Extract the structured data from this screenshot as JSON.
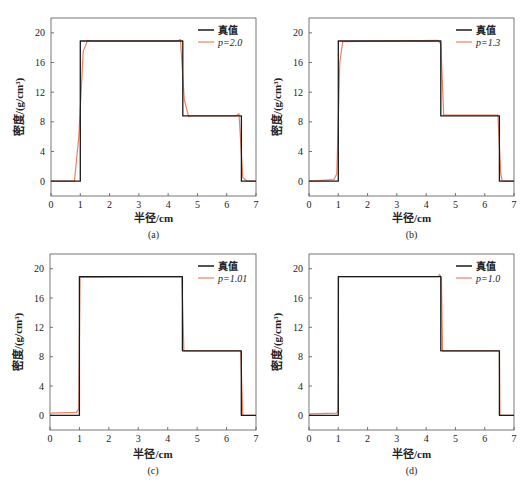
{
  "figure": {
    "background": "#ffffff",
    "colors": {
      "true_value": "#1a1a1a",
      "reconstruction": "#f08060",
      "axis": "#555555"
    }
  },
  "chart_data": [
    {
      "type": "line",
      "panel_label": "(a)",
      "xlabel": "半径/cm",
      "ylabel": "密度/(g/cm³)",
      "xlim": [
        0,
        7
      ],
      "ylim": [
        -2,
        22
      ],
      "xticks": [
        0,
        1,
        2,
        3,
        4,
        5,
        6,
        7
      ],
      "yticks": [
        0,
        4,
        8,
        12,
        16,
        20
      ],
      "grid": false,
      "legend_position": "upper right",
      "series": [
        {
          "name": "真值",
          "color": "#1a1a1a",
          "x": [
            0,
            1.0,
            1.0,
            4.5,
            4.5,
            6.5,
            6.5,
            7
          ],
          "y": [
            0,
            0,
            18.9,
            18.9,
            8.8,
            8.8,
            0,
            0
          ]
        },
        {
          "name": "p=2.0",
          "color": "#f08060",
          "x": [
            0,
            0.8,
            0.95,
            1.1,
            1.25,
            1.4,
            4.3,
            4.42,
            4.55,
            4.7,
            4.85,
            6.3,
            6.42,
            6.55,
            6.7,
            7
          ],
          "y": [
            0,
            0,
            6,
            17.5,
            19.0,
            18.9,
            18.9,
            19.1,
            11,
            8.7,
            8.8,
            8.8,
            9.1,
            0.5,
            0,
            0
          ]
        }
      ]
    },
    {
      "type": "line",
      "panel_label": "(b)",
      "xlabel": "半径/cm",
      "ylabel": "密度/(g/cm³)",
      "xlim": [
        0,
        7
      ],
      "ylim": [
        -2,
        22
      ],
      "xticks": [
        0,
        1,
        2,
        3,
        4,
        5,
        6,
        7
      ],
      "yticks": [
        0,
        4,
        8,
        12,
        16,
        20
      ],
      "grid": false,
      "legend_position": "upper right",
      "series": [
        {
          "name": "真值",
          "color": "#1a1a1a",
          "x": [
            0,
            1.0,
            1.0,
            4.5,
            4.5,
            6.5,
            6.5,
            7
          ],
          "y": [
            0,
            0,
            18.9,
            18.9,
            8.8,
            8.8,
            0,
            0
          ]
        },
        {
          "name": "p=1.3",
          "color": "#f08060",
          "x": [
            0,
            0.85,
            0.95,
            1.05,
            1.15,
            4.4,
            4.5,
            4.6,
            6.45,
            6.55,
            6.6,
            7
          ],
          "y": [
            0,
            0.2,
            1.0,
            16,
            18.8,
            19.0,
            18.5,
            8.9,
            8.9,
            1.0,
            0,
            0
          ]
        }
      ]
    },
    {
      "type": "line",
      "panel_label": "(c)",
      "xlabel": "半径/cm",
      "ylabel": "密度/(g/cm³)",
      "xlim": [
        0,
        7
      ],
      "ylim": [
        -2,
        22
      ],
      "xticks": [
        0,
        1,
        2,
        3,
        4,
        5,
        6,
        7
      ],
      "yticks": [
        0,
        4,
        8,
        12,
        16,
        20
      ],
      "grid": false,
      "legend_position": "upper right",
      "series": [
        {
          "name": "真值",
          "color": "#1a1a1a",
          "x": [
            0,
            1.0,
            1.0,
            4.5,
            4.5,
            6.5,
            6.5,
            7
          ],
          "y": [
            0,
            0,
            18.9,
            18.9,
            8.8,
            8.8,
            0,
            0
          ]
        },
        {
          "name": "p=1.01",
          "color": "#f08060",
          "x": [
            0,
            0.9,
            0.98,
            1.02,
            4.48,
            4.55,
            6.48,
            6.55,
            7
          ],
          "y": [
            0.3,
            0.4,
            0.9,
            18.8,
            18.9,
            8.8,
            8.8,
            0,
            0
          ]
        }
      ]
    },
    {
      "type": "line",
      "panel_label": "(d)",
      "xlabel": "半径/cm",
      "ylabel": "密度/(g/cm³)",
      "xlim": [
        0,
        7
      ],
      "ylim": [
        -2,
        22
      ],
      "xticks": [
        0,
        1,
        2,
        3,
        4,
        5,
        6,
        7
      ],
      "yticks": [
        0,
        4,
        8,
        12,
        16,
        20
      ],
      "grid": false,
      "legend_position": "upper right",
      "series": [
        {
          "name": "真值",
          "color": "#1a1a1a",
          "x": [
            0,
            1.0,
            1.0,
            4.5,
            4.5,
            6.5,
            6.5,
            7
          ],
          "y": [
            0,
            0,
            18.9,
            18.9,
            8.8,
            8.8,
            0,
            0
          ]
        },
        {
          "name": "p=1.0",
          "color": "#f08060",
          "x": [
            0,
            0.95,
            0.99,
            1.01,
            4.4,
            4.46,
            4.52,
            4.56,
            6.5,
            6.52,
            7
          ],
          "y": [
            0.2,
            0.3,
            0.7,
            18.9,
            18.9,
            19.2,
            18.8,
            8.8,
            8.8,
            0,
            0
          ]
        }
      ]
    }
  ],
  "panels_layout": [
    {
      "plot": [
        51,
        18,
        256,
        196
      ],
      "caption_y": 238,
      "xlabel_y": 222
    },
    {
      "plot": [
        309,
        18,
        514,
        196
      ],
      "caption_y": 238,
      "xlabel_y": 222
    },
    {
      "plot": [
        50,
        254,
        256,
        430
      ],
      "caption_y": 474,
      "xlabel_y": 458
    },
    {
      "plot": [
        309,
        254,
        514,
        430
      ],
      "caption_y": 474,
      "xlabel_y": 458
    }
  ]
}
